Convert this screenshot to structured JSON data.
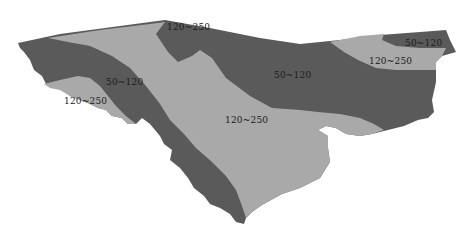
{
  "map": {
    "colors": {
      "dark_zone": "#5a5a5a",
      "light_zone": "#a9a9a9",
      "background": "#ffffff"
    },
    "legend_classes": [
      "50~120",
      "120~250"
    ],
    "labels": [
      {
        "id": "top-center",
        "text": "120~250",
        "x": 167,
        "y": 22
      },
      {
        "id": "upper-right",
        "text": "50~120",
        "x": 405,
        "y": 38
      },
      {
        "id": "right-middle",
        "text": "120~250",
        "x": 369,
        "y": 56
      },
      {
        "id": "center",
        "text": "50~120",
        "x": 274,
        "y": 70
      },
      {
        "id": "left-dark",
        "text": "50~120",
        "x": 106,
        "y": 77
      },
      {
        "id": "left-light",
        "text": "120~250",
        "x": 64,
        "y": 96
      },
      {
        "id": "center-light",
        "text": "120~250",
        "x": 225,
        "y": 115
      }
    ]
  }
}
